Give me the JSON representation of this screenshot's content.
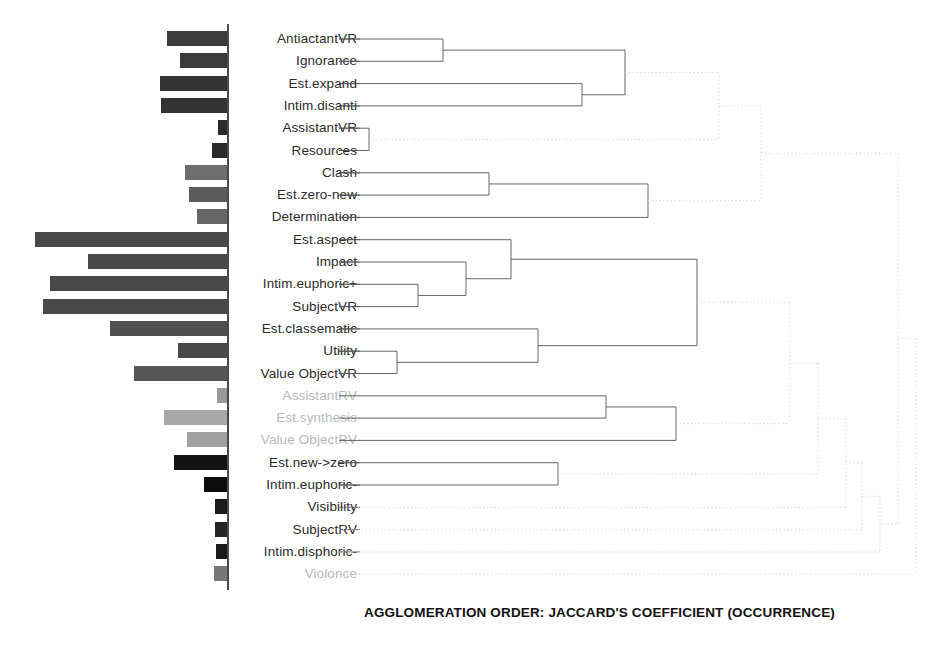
{
  "chart_data": {
    "type": "bar",
    "title": "AGGLOMERATION ORDER: JACCARD'S COEFFICIENT (OCCURRENCE)",
    "subtitle": "",
    "xlabel": "",
    "ylabel": "",
    "orientation": "horizontal-left",
    "grid": false,
    "legend": "none",
    "axis_x_px": 227,
    "categories": [
      "AntiactantVR",
      "Ignorance",
      "Est.expand",
      "Intim.disanti",
      "AssistantVR",
      "Resources",
      "Clash",
      "Est.zero-new",
      "Determination",
      "Est.aspect",
      "Impact",
      "Intim.euphoric+",
      "SubjectVR",
      "Est.classematic",
      "Utility",
      "Value ObjectVR",
      "AssistantRV",
      "Est.synthesis",
      "Value ObjectRV",
      "Est.new->zero",
      "Intim.euphoric-",
      "Visibility",
      "SubjectRV",
      "Intim.disphoric-",
      "Violonce"
    ],
    "values": [
      60,
      47,
      67,
      66,
      9,
      15,
      42,
      38,
      30,
      192,
      139,
      177,
      184,
      117,
      49,
      93,
      10,
      63,
      40,
      53,
      23,
      12,
      12,
      11,
      13
    ],
    "bar_colors": [
      "#3b3b3b",
      "#3b3b3b",
      "#333333",
      "#333333",
      "#2b2b2b",
      "#2b2b2b",
      "#6e6e6e",
      "#5c5c5c",
      "#666666",
      "#4a4a4a",
      "#4a4a4a",
      "#484848",
      "#484848",
      "#4f4f4f",
      "#4a4a4a",
      "#565656",
      "#9a9a9a",
      "#a8a8a8",
      "#a0a0a0",
      "#121212",
      "#0d0d0d",
      "#1c1c1c",
      "#242424",
      "#1a1a1a",
      "#777777"
    ],
    "muted_labels": [
      "AssistantRV",
      "Est.synthesis",
      "Value ObjectRV",
      "Violonce"
    ],
    "dendrogram": {
      "solid_color": "#555555",
      "dotted_color": "#cfcfcf",
      "merges": [
        {
          "id": "m1",
          "children": [
            "AntiactantVR",
            "Ignorance"
          ],
          "x": 443,
          "style": "solid"
        },
        {
          "id": "m2",
          "children": [
            "Est.expand",
            "Intim.disanti"
          ],
          "x": 582,
          "style": "solid"
        },
        {
          "id": "m3",
          "children": [
            "m1",
            "m2"
          ],
          "x": 625,
          "style": "solid"
        },
        {
          "id": "m4",
          "children": [
            "AssistantVR",
            "Resources"
          ],
          "x": 369,
          "style": "solid"
        },
        {
          "id": "m5",
          "children": [
            "m3",
            "m4"
          ],
          "x": 719,
          "style": "dotted"
        },
        {
          "id": "m6",
          "children": [
            "Clash",
            "Est.zero-new"
          ],
          "x": 489,
          "style": "solid"
        },
        {
          "id": "m7",
          "children": [
            "m6",
            "Determination"
          ],
          "x": 648,
          "style": "solid"
        },
        {
          "id": "m8",
          "children": [
            "m5",
            "m7"
          ],
          "x": 761,
          "style": "dotted"
        },
        {
          "id": "m9",
          "children": [
            "Intim.euphoric+",
            "SubjectVR"
          ],
          "x": 418,
          "style": "solid"
        },
        {
          "id": "m10",
          "children": [
            "Impact",
            "m9"
          ],
          "x": 466,
          "style": "solid"
        },
        {
          "id": "m11",
          "children": [
            "Est.aspect",
            "m10"
          ],
          "x": 511,
          "style": "solid"
        },
        {
          "id": "m12",
          "children": [
            "Utility",
            "Value ObjectVR"
          ],
          "x": 397,
          "style": "solid"
        },
        {
          "id": "m13",
          "children": [
            "Est.classematic",
            "m12"
          ],
          "x": 538,
          "style": "solid"
        },
        {
          "id": "m14",
          "children": [
            "m11",
            "m13"
          ],
          "x": 697,
          "style": "solid"
        },
        {
          "id": "m15",
          "children": [
            "AssistantRV",
            "Est.synthesis"
          ],
          "x": 606,
          "style": "solid"
        },
        {
          "id": "m16",
          "children": [
            "m15",
            "Value ObjectRV"
          ],
          "x": 676,
          "style": "solid"
        },
        {
          "id": "m17",
          "children": [
            "m14",
            "m16"
          ],
          "x": 790,
          "style": "dotted"
        },
        {
          "id": "m18",
          "children": [
            "Est.new->zero",
            "Intim.euphoric-"
          ],
          "x": 558,
          "style": "solid"
        },
        {
          "id": "m19",
          "children": [
            "m17",
            "m18"
          ],
          "x": 818,
          "style": "dotted"
        },
        {
          "id": "m20",
          "children": [
            "m19",
            "Visibility"
          ],
          "x": 846,
          "style": "dotted"
        },
        {
          "id": "m21",
          "children": [
            "m20",
            "SubjectRV"
          ],
          "x": 862,
          "style": "dotted"
        },
        {
          "id": "m22",
          "children": [
            "m21",
            "Intim.disphoric-"
          ],
          "x": 880,
          "style": "dotted"
        },
        {
          "id": "m23",
          "children": [
            "m8",
            "m22"
          ],
          "x": 898,
          "style": "dotted"
        },
        {
          "id": "m24",
          "children": [
            "m23",
            "Violonce"
          ],
          "x": 916,
          "style": "dotted"
        }
      ]
    }
  }
}
